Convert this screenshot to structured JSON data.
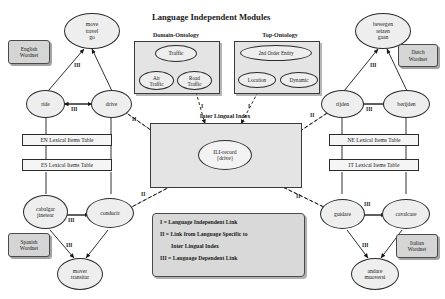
{
  "title": "Language Independent Modules",
  "captions": {
    "domain_ontology": "Domain-Ontology",
    "top_ontology": "Top-Ontology",
    "ili": "Inter Lingual Index"
  },
  "ili_record": "ILI-record\n{drive}",
  "ili_record_line1": "ILI-record",
  "ili_record_line2": "{drive}",
  "wordnets": {
    "english": "English\nWordnet",
    "english_l1": "English",
    "english_l2": "Wordnet",
    "dutch_l1": "Dutch",
    "dutch_l2": "Wordnet",
    "spanish_l1": "Spanish",
    "spanish_l2": "Wordnet",
    "italian_l1": "Italian",
    "italian_l2": "Wordnet"
  },
  "tables": {
    "en": "EN Lexical Items Table",
    "es": "ES Lexical Items Table",
    "ne": "NE Lexical Items Table",
    "it": "IT Lexical Items Table"
  },
  "english": {
    "top_l1": "move",
    "top_l2": "travel",
    "top_l3": "go",
    "left": "ride",
    "right": "drive"
  },
  "dutch": {
    "top_l1": "bewegen",
    "top_l2": "reizen",
    "top_l3": "gaan",
    "left": "rijden",
    "right": "berijden"
  },
  "spanish": {
    "left_l1": "cabalgar",
    "left_l2": "jinetear",
    "right": "conducir",
    "bottom_l1": "mover",
    "bottom_l2": "transitar"
  },
  "italian": {
    "left": "guidare",
    "right": "cavalcare",
    "bottom_l1": "andare",
    "bottom_l2": "muoversi"
  },
  "domain_ontology": {
    "root": "Traffic",
    "left_l1": "Air",
    "left_l2": "Traffic",
    "right_l1": "Road",
    "right_l2": "Traffic"
  },
  "top_ontology": {
    "root": "2nd Order Entity",
    "left": "Location",
    "right": "Dynamic"
  },
  "link_labels": {
    "i": "I",
    "ii": "II",
    "iii": "III"
  },
  "legend": {
    "line1": "I = Language Independent Link",
    "line2a": "II = Link from  Language Specific to",
    "line2b": "Inter Lingual Index",
    "line3": "III = Language Dependent Link"
  },
  "colors": {
    "node_fill": "#eeeeee",
    "panel_fill": "#e4e4e4",
    "wordnet_fill": "#d5d5d5",
    "legend_fill": "#d9d9d9",
    "stroke": "#2b2b2b"
  }
}
